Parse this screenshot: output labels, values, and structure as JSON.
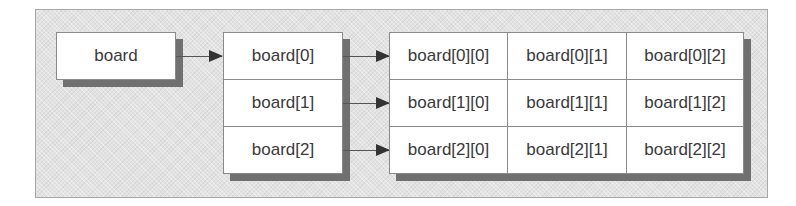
{
  "diagram": {
    "root": {
      "label": "board"
    },
    "rows": [
      {
        "label": "board[0]"
      },
      {
        "label": "board[1]"
      },
      {
        "label": "board[2]"
      }
    ],
    "grid": [
      [
        "board[0][0]",
        "board[0][1]",
        "board[0][2]"
      ],
      [
        "board[1][0]",
        "board[1][1]",
        "board[1][2]"
      ],
      [
        "board[2][0]",
        "board[2][1]",
        "board[2][2]"
      ]
    ],
    "edges": [
      {
        "from": "board",
        "to": "board[0]"
      },
      {
        "from": "board[0]",
        "to": "board[0][0]"
      },
      {
        "from": "board[1]",
        "to": "board[1][0]"
      },
      {
        "from": "board[2]",
        "to": "board[2][0]"
      }
    ],
    "colors": {
      "panel_background": "#e2e2e2",
      "box_fill": "#ffffff",
      "box_border": "#8a8a8a",
      "shadow": "#707070",
      "text": "#3a3a3a",
      "arrow": "#333333"
    }
  }
}
